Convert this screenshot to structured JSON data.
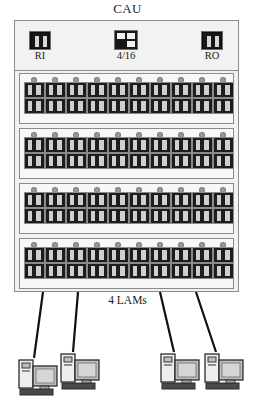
{
  "diagram": {
    "title": "CAU",
    "caption": "4 LAMs",
    "header": {
      "ring_in": {
        "label": "RI",
        "icon": "connector-icon"
      },
      "ratio": {
        "label": "4/16",
        "icon": "ratio-icon"
      },
      "ring_out": {
        "label": "RO",
        "icon": "connector-icon"
      }
    },
    "lam_count": 4,
    "ports_per_lam": 10,
    "connectors_per_port": 2,
    "lams": [
      {
        "name": "LAM 1",
        "ports": [
          1,
          2,
          3,
          4,
          5,
          6,
          7,
          8,
          9,
          10
        ]
      },
      {
        "name": "LAM 2",
        "ports": [
          1,
          2,
          3,
          4,
          5,
          6,
          7,
          8,
          9,
          10
        ]
      },
      {
        "name": "LAM 3",
        "ports": [
          1,
          2,
          3,
          4,
          5,
          6,
          7,
          8,
          9,
          10
        ]
      },
      {
        "name": "LAM 4",
        "ports": [
          1,
          2,
          3,
          4,
          5,
          6,
          7,
          8,
          9,
          10
        ]
      }
    ],
    "workstations": [
      {
        "name": "workstation-1"
      },
      {
        "name": "workstation-2"
      },
      {
        "name": "workstation-3"
      },
      {
        "name": "workstation-4"
      }
    ],
    "cable_count": 4,
    "colors": {
      "chassis_fill": "#f2f2f0",
      "chassis_stroke": "#8b8b8b",
      "row_fill": "#f7f7f5",
      "connector_dark": "#1d1d1d",
      "connector_light": "#cfcfcf",
      "led": "#9a9a9a",
      "cable": "#111111",
      "text": "#1b1b1b"
    }
  }
}
